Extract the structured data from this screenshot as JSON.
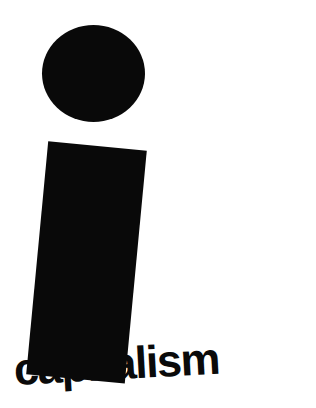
{
  "image": {
    "kind": "minimal-pictogram-poster",
    "background_color": "#ffffff",
    "ink_color": "#090909"
  },
  "caption": {
    "text": "capitalism",
    "obscured_note": "middle letters hidden behind figure body; letter bottoms cropped by image edge",
    "visible_left_fragment": "cap",
    "visible_right_fragment": "talism",
    "color": "#0a0a0a",
    "weight": "bold",
    "rotation_deg": -3.2
  },
  "figure": {
    "head": {
      "shape": "circle",
      "color": "#090909",
      "x": 42,
      "y": 25,
      "width": 103,
      "height": 97
    },
    "body": {
      "shape": "rectangle",
      "color": "#090909",
      "x": 48,
      "y": 146,
      "width": 99,
      "height": 234,
      "rotation_deg": 5.4
    }
  }
}
